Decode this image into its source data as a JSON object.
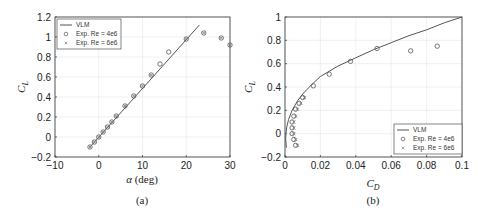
{
  "chart_data": [
    {
      "type": "line",
      "caption": "(a)",
      "title": "",
      "xlabel": "α (deg)",
      "ylabel": "C_L",
      "xlim": [
        -10,
        30
      ],
      "ylim": [
        -0.2,
        1.2
      ],
      "xticks": [
        -10,
        0,
        10,
        20,
        30
      ],
      "xtick_labels": [
        "−10",
        "0",
        "10",
        "20",
        "30"
      ],
      "yticks": [
        -0.2,
        0,
        0.2,
        0.4,
        0.6,
        0.8,
        1,
        1.2
      ],
      "ytick_labels": [
        "−0.2",
        "0",
        "0.2",
        "0.4",
        "0.6",
        "0.8",
        "1",
        "1.2"
      ],
      "grid": true,
      "legend_position": "top-left",
      "series": [
        {
          "name": "VLM",
          "kind": "line",
          "x": [
            -2,
            23
          ],
          "y": [
            -0.1,
            1.12
          ]
        },
        {
          "name": "Exp. Re = 4e6",
          "kind": "circle",
          "x": [
            -2,
            -1,
            0,
            1,
            2,
            3,
            4,
            6,
            8,
            10,
            12,
            14,
            16,
            20,
            24,
            28,
            30
          ],
          "y": [
            -0.1,
            -0.05,
            0,
            0.05,
            0.1,
            0.15,
            0.21,
            0.31,
            0.41,
            0.51,
            0.62,
            0.73,
            0.85,
            0.98,
            1.04,
            0.99,
            0.92
          ]
        },
        {
          "name": "Exp. Re = 6e6",
          "kind": "x",
          "x": [
            -2,
            -1,
            0,
            1,
            2,
            3,
            4,
            6,
            8,
            10,
            12,
            20,
            24,
            28,
            30
          ],
          "y": [
            -0.1,
            -0.05,
            0,
            0.05,
            0.1,
            0.15,
            0.21,
            0.31,
            0.41,
            0.51,
            0.62,
            0.98,
            1.04,
            0.99,
            0.92
          ]
        }
      ]
    },
    {
      "type": "line",
      "caption": "(b)",
      "title": "",
      "xlabel": "C_D",
      "ylabel": "C_L",
      "xlim": [
        0,
        0.1
      ],
      "ylim": [
        -0.2,
        1
      ],
      "xticks": [
        0,
        0.02,
        0.04,
        0.06,
        0.08,
        0.1
      ],
      "xtick_labels": [
        "0",
        "0.02",
        "0.04",
        "0.06",
        "0.08",
        "0.1"
      ],
      "yticks": [
        -0.2,
        0,
        0.2,
        0.4,
        0.6,
        0.8,
        1
      ],
      "ytick_labels": [
        "−0.2",
        "0",
        "0.2",
        "0.4",
        "0.6",
        "0.8",
        "1"
      ],
      "grid": true,
      "legend_position": "bottom-right",
      "series": [
        {
          "name": "VLM",
          "kind": "line",
          "x": [
            0.0008,
            0.0004,
            0.0005,
            0.001,
            0.002,
            0.004,
            0.007,
            0.01,
            0.015,
            0.02,
            0.03,
            0.04,
            0.05,
            0.06,
            0.07,
            0.08,
            0.09,
            0.1
          ],
          "y": [
            -0.12,
            -0.05,
            0.0,
            0.06,
            0.12,
            0.2,
            0.28,
            0.34,
            0.42,
            0.49,
            0.58,
            0.65,
            0.72,
            0.78,
            0.84,
            0.89,
            0.95,
            1.0
          ]
        },
        {
          "name": "Exp. Re = 4e6",
          "kind": "circle",
          "x": [
            0.006,
            0.005,
            0.004,
            0.004,
            0.004,
            0.005,
            0.006,
            0.008,
            0.01,
            0.016,
            0.025,
            0.037,
            0.052,
            0.071,
            0.086
          ],
          "y": [
            -0.1,
            -0.05,
            0.0,
            0.05,
            0.1,
            0.15,
            0.21,
            0.26,
            0.31,
            0.41,
            0.51,
            0.62,
            0.73,
            0.71,
            0.75
          ]
        },
        {
          "name": "Exp. Re = 6e6",
          "kind": "x",
          "x": [
            0.007,
            0.006,
            0.005,
            0.005,
            0.005,
            0.006,
            0.007,
            0.009,
            0.011
          ],
          "y": [
            -0.1,
            -0.05,
            0.0,
            0.05,
            0.1,
            0.15,
            0.21,
            0.26,
            0.31
          ]
        }
      ]
    }
  ]
}
